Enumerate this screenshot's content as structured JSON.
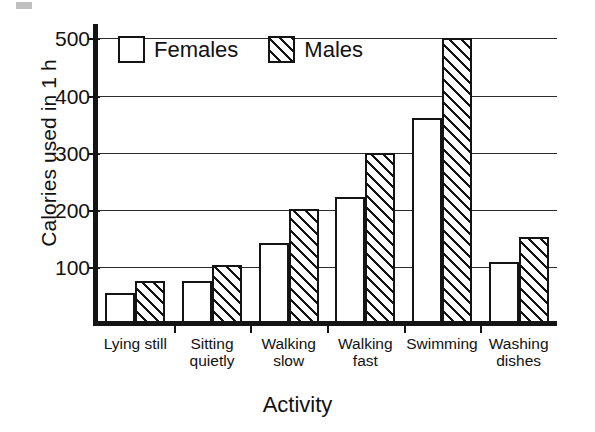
{
  "chart_data": {
    "type": "bar",
    "title": "",
    "xlabel": "Activity",
    "ylabel": "Calories used in 1 h",
    "categories": [
      "Lying still",
      "Sitting\nquietly",
      "Walking\nslow",
      "Walking\nfast",
      "Swimming",
      "Washing\ndishes"
    ],
    "series": [
      {
        "name": "Females",
        "values": [
          55,
          75,
          142,
          222,
          360,
          108
        ],
        "fill": "solid-white"
      },
      {
        "name": "Males",
        "values": [
          75,
          103,
          202,
          300,
          500,
          152
        ],
        "fill": "diagonal-hatch"
      }
    ],
    "ylim": [
      0,
      520
    ],
    "yticks": [
      100,
      200,
      300,
      400,
      500
    ],
    "ytick_labels": [
      "100",
      "200",
      "300",
      "400",
      "500"
    ],
    "grid": true,
    "grid_axis": "y",
    "legend_position": "top-left-inside"
  },
  "legend": {
    "entries": [
      {
        "label": "Females"
      },
      {
        "label": "Males"
      }
    ]
  },
  "colors": {
    "ink": "#141414",
    "background": "#ffffff",
    "gridline": "#2b2b2b"
  }
}
